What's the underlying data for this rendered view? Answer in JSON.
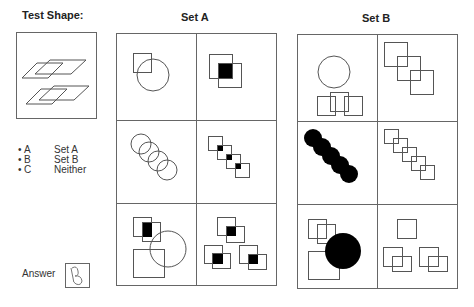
{
  "test_shape": {
    "title": "Test Shape:",
    "description": "Two pairs of overlapping outlined parallelograms"
  },
  "options": [
    {
      "bullet": "•",
      "letter": "A",
      "label": "Set A"
    },
    {
      "bullet": "•",
      "letter": "B",
      "label": "Set B"
    },
    {
      "bullet": "•",
      "letter": "C",
      "label": "Neither"
    }
  ],
  "answer": {
    "label": "Answer",
    "value": "B",
    "icon": "handwritten-answer-icon"
  },
  "set_a": {
    "title": "Set A",
    "cells": [
      "square overlapping circle",
      "two overlapping squares with filled intersection",
      "four overlapping circles in diagonal chain",
      "four squares in diagonal chain with filled intersections",
      "two overlapping squares (filled intersection), circle overlapping large square",
      "three pairs of overlapping squares with filled intersections"
    ]
  },
  "set_b": {
    "title": "Set B",
    "cells": [
      "circle above three overlapping squares",
      "three overlapping squares in diagonal",
      "five filled circles in diagonal chain",
      "five overlapping squares in diagonal chain",
      "two overlapping squares, large square, filled circle",
      "single square and two pairs of overlapping squares"
    ]
  },
  "colors": {
    "stroke": "#555555",
    "fill": "#000000",
    "border": "#666666"
  }
}
